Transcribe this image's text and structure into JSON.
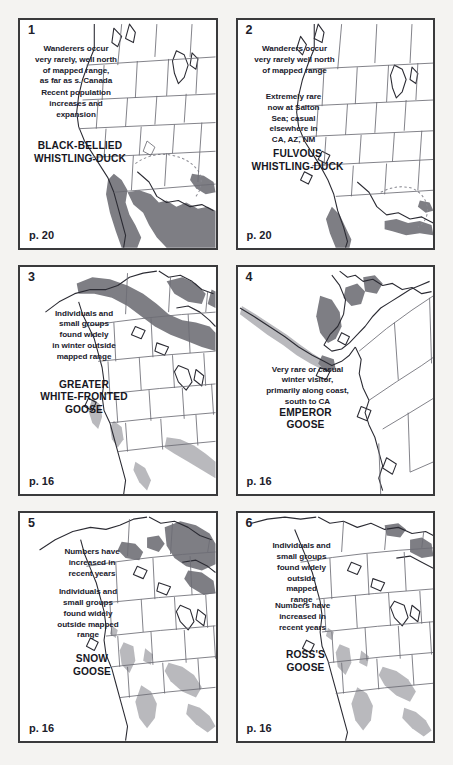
{
  "page": {
    "background_color": "#f4f3f1",
    "panel_border_color": "#3a3a3c",
    "panel_background_color": "#ffffff",
    "columns": 2,
    "rows": 3
  },
  "legend_colors": {
    "breeding_range_dark_gray": "#808085",
    "winter_range_light_gray": "#b9b9bd",
    "coastline": "#2b2b33",
    "state_border": "#6d6d75",
    "dashed_boundary": "#8a8a92"
  },
  "panels": [
    {
      "number": "1",
      "species": "BLACK-BELLIED\nWHISTLING-DUCK",
      "page_ref": "p. 20",
      "notes": [
        "Wanderers occur\nvery rarely, well north\nof mapped range,\nas far as s. Canada",
        "Recent population\nincreases and\nexpansion"
      ],
      "map_region": "western-and-southern-north-america"
    },
    {
      "number": "2",
      "species": "FULVOUS\nWHISTLING-DUCK",
      "page_ref": "p. 20",
      "notes": [
        "Wanderers occur\nvery rarely well north\nof mapped range",
        "Extremely rare\nnow at Salton\nSea; casual\nelsewhere in\nCA, AZ, NM"
      ],
      "map_region": "western-and-southern-north-america"
    },
    {
      "number": "3",
      "species": "GREATER\nWHITE-FRONTED\nGOOSE",
      "page_ref": "p. 16",
      "notes": [
        "Individuals and\nsmall groups\nfound widely\nin winter outside\nmapped range"
      ],
      "map_region": "western-north-america-with-alaska"
    },
    {
      "number": "4",
      "species": "EMPEROR\nGOOSE",
      "page_ref": "p. 16",
      "notes": [
        "Very rare or casual\nwinter visitor,\nprimarily along coast,\nsouth to CA"
      ],
      "map_region": "alaska-and-aleutians"
    },
    {
      "number": "5",
      "species": "SNOW\nGOOSE",
      "page_ref": "p. 16",
      "notes": [
        "Numbers have\nincreased in\nrecent years",
        "Individuals and\nsmall groups\nfound widely\noutside mapped\nrange"
      ],
      "map_region": "western-north-america-with-alaska"
    },
    {
      "number": "6",
      "species": "ROSS'S\nGOOSE",
      "page_ref": "p. 16",
      "notes": [
        "Individuals and\nsmall groups\nfound widely\noutside\nmapped\nrange",
        "Numbers have\nincreased in\nrecent years"
      ],
      "map_region": "western-north-america-with-alaska"
    }
  ]
}
